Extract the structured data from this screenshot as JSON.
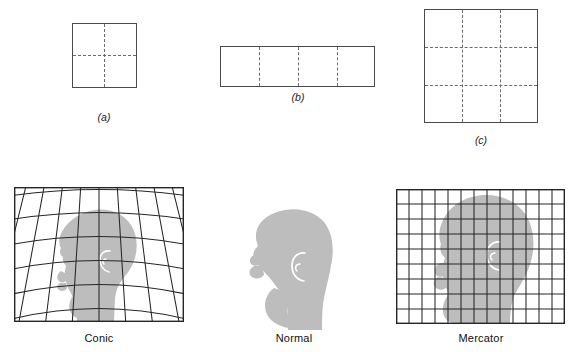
{
  "figure": {
    "title_visible": false,
    "background_color": "#ffffff",
    "line_color": "#4a4a4a",
    "dash_color": "#6b6b6b",
    "silhouette_color": "#bdbdbd",
    "grid_color": "#262626"
  },
  "top_row": {
    "items": [
      {
        "id": "a",
        "caption": "(a)",
        "shape": "square",
        "x": 72,
        "y": 23,
        "width": 65,
        "height": 65,
        "vertical_dashed_lines": 1,
        "horizontal_dashed_lines": 1,
        "columns": 2,
        "rows": 2,
        "caption_x": 104,
        "caption_y": 118
      },
      {
        "id": "b",
        "caption": "(b)",
        "shape": "rectangle",
        "x": 220,
        "y": 46,
        "width": 155,
        "height": 41,
        "vertical_dashed_lines": 3,
        "horizontal_dashed_lines": 0,
        "columns": 4,
        "rows": 1,
        "caption_x": 298,
        "caption_y": 97
      },
      {
        "id": "c",
        "caption": "(c)",
        "shape": "square",
        "x": 424,
        "y": 9,
        "width": 114,
        "height": 114,
        "vertical_dashed_lines": 2,
        "horizontal_dashed_lines": 2,
        "columns": 3,
        "rows": 3,
        "caption_x": 481,
        "caption_y": 141
      }
    ]
  },
  "bottom_row": {
    "panels": [
      {
        "id": "conic",
        "label": "Conic",
        "projection": "conic",
        "x": 14,
        "y": 187,
        "width": 170,
        "height": 135,
        "grid_columns": 9,
        "grid_rows": 6,
        "grid_type": "curved-fan",
        "head_orientation": "facing-right",
        "label_x": 99,
        "label_y": 332
      },
      {
        "id": "normal",
        "label": "Normal",
        "projection": "none",
        "x": 250,
        "y": 210,
        "width": 90,
        "height": 118,
        "grid_columns": 0,
        "grid_rows": 0,
        "grid_type": "none",
        "head_orientation": "facing-left",
        "label_x": 294,
        "label_y": 332
      },
      {
        "id": "mercator",
        "label": "Mercator",
        "projection": "mercator",
        "x": 396,
        "y": 189,
        "width": 169,
        "height": 135,
        "grid_columns": 13,
        "grid_rows": 9,
        "grid_type": "rectilinear",
        "head_orientation": "facing-right",
        "label_x": 481,
        "label_y": 332
      }
    ]
  }
}
